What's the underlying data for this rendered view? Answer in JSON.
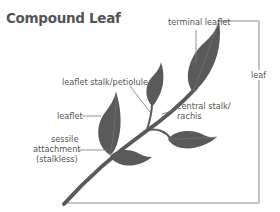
{
  "title": "Compound Leaf",
  "labels": {
    "terminal_leaflet": "terminal leaflet",
    "leaf": "leaf",
    "leaflet_stalk": "leaflet stalk/petiolule",
    "central_stalk_line1": "central stalk/",
    "central_stalk_line2": "rachis",
    "leaflet": "leaflet",
    "sessile_line1": "sessile",
    "sessile_line2": "attachment",
    "sessile_line3": "(stalkless)"
  },
  "colors": {
    "leaf_fill": "#5a5a5a",
    "vein": "#7a7a7a",
    "leader_line": "#777777",
    "text": "#555555"
  }
}
